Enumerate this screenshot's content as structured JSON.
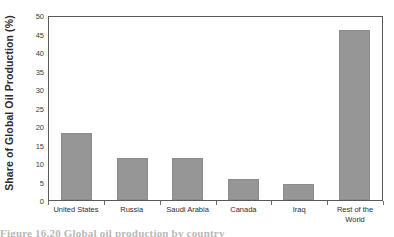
{
  "chart_data": {
    "type": "bar",
    "title": "",
    "xlabel": "",
    "ylabel": "Share of Global Oil Production (%)",
    "categories": [
      "United States",
      "Russia",
      "Saudi Arabia",
      "Canada",
      "Iraq",
      "Rest of the World"
    ],
    "values": [
      18.3,
      11.6,
      11.6,
      5.8,
      4.4,
      46.4
    ],
    "ylim": [
      0,
      50
    ],
    "ytick_labels": [
      "0",
      "5",
      "10",
      "15",
      "20",
      "25",
      "30",
      "35",
      "40",
      "45",
      "50"
    ],
    "ytick_values": [
      0,
      5,
      10,
      15,
      20,
      25,
      30,
      35,
      40,
      45,
      50
    ],
    "grid": false,
    "legend": false,
    "bar_color": "#969696",
    "axis_color": "#595959",
    "text_color": "#2b2b2b"
  },
  "caption": {
    "text": "Figure 16.20  Global oil production by country"
  }
}
